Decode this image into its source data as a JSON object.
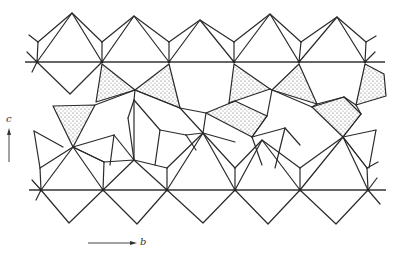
{
  "figure": {
    "axes": {
      "vertical": {
        "label": "c"
      },
      "horizontal": {
        "label": "b"
      }
    },
    "colors": {
      "line": "#2a2a2a",
      "stipple": "#555555",
      "background": "#ffffff"
    },
    "layers": [
      {
        "name": "top-octahedral-chain",
        "baseline_y": 62
      },
      {
        "name": "middle-shaded-layer"
      },
      {
        "name": "bottom-octahedral-chain",
        "baseline_y": 190
      }
    ]
  }
}
